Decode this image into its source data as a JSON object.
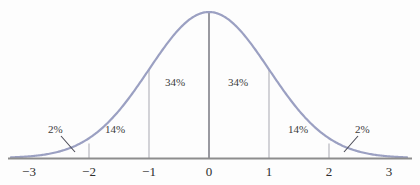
{
  "chart_data": {
    "type": "line",
    "title": "",
    "subtitle": "",
    "xlabel": "",
    "ylabel": "",
    "xlim": [
      -3.3,
      3.3
    ],
    "ylim": [
      0,
      1.05
    ],
    "grid": false,
    "legend": null,
    "curve": {
      "name": "standard normal density",
      "mean": 0,
      "sd": 1,
      "color": "#9ba0c2",
      "stroke_width": 2.2
    },
    "x_ticks": [
      {
        "value": -3,
        "label": "−3"
      },
      {
        "value": -2,
        "label": "−2"
      },
      {
        "value": -1,
        "label": "−1"
      },
      {
        "value": 0,
        "label": "0"
      },
      {
        "value": 1,
        "label": "1"
      },
      {
        "value": 2,
        "label": "2"
      },
      {
        "value": 3,
        "label": "3"
      }
    ],
    "y_ticks": [],
    "vertical_lines": [
      {
        "at": -2,
        "style": "short-stub",
        "color": "#b0b0b8"
      },
      {
        "at": -1,
        "style": "to-curve",
        "color": "#b0b0b8"
      },
      {
        "at": 0,
        "style": "to-peak",
        "color": "#6e6e78"
      },
      {
        "at": 1,
        "style": "to-curve",
        "color": "#b0b0b8"
      },
      {
        "at": 2,
        "style": "short-stub",
        "color": "#b0b0b8"
      }
    ],
    "region_labels": [
      {
        "id": "left-tail",
        "text": "2%",
        "interval": [
          -3,
          -2
        ],
        "value": 2,
        "leader": true
      },
      {
        "id": "left-mid",
        "text": "14%",
        "interval": [
          -2,
          -1
        ],
        "value": 14,
        "leader": false
      },
      {
        "id": "left-inner",
        "text": "34%",
        "interval": [
          -1,
          0
        ],
        "value": 34,
        "leader": false
      },
      {
        "id": "right-inner",
        "text": "34%",
        "interval": [
          0,
          1
        ],
        "value": 34,
        "leader": false
      },
      {
        "id": "right-mid",
        "text": "14%",
        "interval": [
          1,
          2
        ],
        "value": 14,
        "leader": false
      },
      {
        "id": "right-tail",
        "text": "2%",
        "interval": [
          2,
          3
        ],
        "value": 2,
        "leader": true
      }
    ],
    "axis": {
      "color": "#8d8d8d",
      "baseline_y_px": 158
    }
  },
  "colors": {
    "background": "#fdfdfd",
    "curve": "#9ba0c2",
    "axis": "#8d8d8d",
    "gridline": "#b0b0b8",
    "center_line": "#6e6e78",
    "text": "#2e2e2e",
    "leader": "#4a4a55"
  }
}
